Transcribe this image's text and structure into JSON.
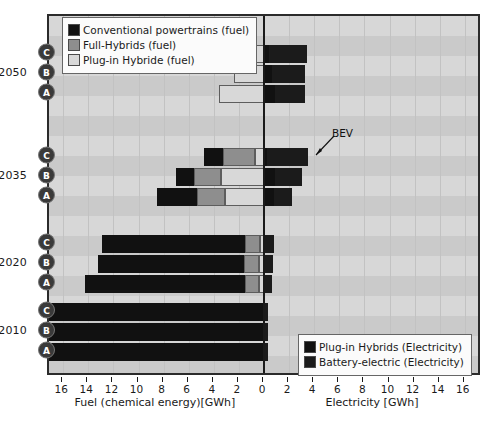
{
  "chart_data": {
    "type": "bar",
    "orientation": "horizontal-diverging",
    "title": "",
    "left_axis": {
      "label": "Fuel (chemical energy)[GWh]",
      "ticks": [
        16,
        14,
        12,
        10,
        8,
        6,
        4,
        2,
        0
      ],
      "direction": "reversed",
      "max": 17.2
    },
    "right_axis": {
      "label": "Electricity [GWh]",
      "ticks": [
        0,
        2,
        4,
        6,
        8,
        10,
        12,
        14,
        16
      ],
      "max": 17.2
    },
    "grid": true,
    "legend_position": [
      "top-left",
      "bottom-right"
    ],
    "year_groups": [
      "2050",
      "2035",
      "2020",
      "2010"
    ],
    "scenario_labels": [
      "C",
      "B",
      "A"
    ],
    "series": [
      {
        "name": "Conventional powertrains (fuel)",
        "color": "#111111",
        "side": "left"
      },
      {
        "name": "Full-Hybrids (fuel)",
        "color": "#8e8e8e",
        "side": "left"
      },
      {
        "name": "Plug-in Hybride (fuel)",
        "color": "#d8d8d8",
        "side": "left"
      },
      {
        "name": "Plug-in Hybrids (Electricity)",
        "color": "#111111",
        "side": "right"
      },
      {
        "name": "Battery-electric (Electricity)",
        "color": "#1b1b1b",
        "side": "right"
      }
    ],
    "annotations": [
      {
        "text": "BEV",
        "target_year": "2035",
        "target_scenario": "C"
      }
    ],
    "bars": [
      {
        "year": "2050",
        "scenario": "C",
        "fuel": {
          "conventional": 0.0,
          "full_hybrid": 0.0,
          "plug_in_hybrid": 1.5
        },
        "electricity": {
          "plug_in_hybrids": 0.4,
          "battery_electric": 3.0
        }
      },
      {
        "year": "2050",
        "scenario": "B",
        "fuel": {
          "conventional": 0.0,
          "full_hybrid": 0.0,
          "plug_in_hybrid": 2.4
        },
        "electricity": {
          "plug_in_hybrids": 0.6,
          "battery_electric": 2.7
        }
      },
      {
        "year": "2050",
        "scenario": "A",
        "fuel": {
          "conventional": 0.0,
          "full_hybrid": 0.0,
          "plug_in_hybrid": 3.6
        },
        "electricity": {
          "plug_in_hybrids": 0.9,
          "battery_electric": 2.4
        }
      },
      {
        "year": "2035",
        "scenario": "C",
        "fuel": {
          "conventional": 1.5,
          "full_hybrid": 2.6,
          "plug_in_hybrid": 0.7
        },
        "electricity": {
          "plug_in_hybrids": 0.2,
          "battery_electric": 3.3
        }
      },
      {
        "year": "2035",
        "scenario": "B",
        "fuel": {
          "conventional": 1.4,
          "full_hybrid": 2.2,
          "plug_in_hybrid": 3.4
        },
        "electricity": {
          "plug_in_hybrids": 0.9,
          "battery_electric": 2.1
        }
      },
      {
        "year": "2035",
        "scenario": "A",
        "fuel": {
          "conventional": 3.2,
          "full_hybrid": 2.2,
          "plug_in_hybrid": 3.1
        },
        "electricity": {
          "plug_in_hybrids": 0.8,
          "battery_electric": 1.4
        }
      },
      {
        "year": "2020",
        "scenario": "C",
        "fuel": {
          "conventional": 11.4,
          "full_hybrid": 1.2,
          "plug_in_hybrid": 0.3
        },
        "electricity": {
          "plug_in_hybrids": 0.1,
          "battery_electric": 0.7
        }
      },
      {
        "year": "2020",
        "scenario": "B",
        "fuel": {
          "conventional": 11.6,
          "full_hybrid": 1.2,
          "plug_in_hybrid": 0.4
        },
        "electricity": {
          "plug_in_hybrids": 0.1,
          "battery_electric": 0.6
        }
      },
      {
        "year": "2020",
        "scenario": "A",
        "fuel": {
          "conventional": 12.8,
          "full_hybrid": 1.1,
          "plug_in_hybrid": 0.4
        },
        "electricity": {
          "plug_in_hybrids": 0.1,
          "battery_electric": 0.5
        }
      },
      {
        "year": "2010",
        "scenario": "C",
        "fuel": {
          "conventional": 17.2,
          "full_hybrid": 0.0,
          "plug_in_hybrid": 0.0
        },
        "electricity": {
          "plug_in_hybrids": 0.0,
          "battery_electric": 0.3
        }
      },
      {
        "year": "2010",
        "scenario": "B",
        "fuel": {
          "conventional": 17.2,
          "full_hybrid": 0.0,
          "plug_in_hybrid": 0.0
        },
        "electricity": {
          "plug_in_hybrids": 0.0,
          "battery_electric": 0.3
        }
      },
      {
        "year": "2010",
        "scenario": "A",
        "fuel": {
          "conventional": 17.2,
          "full_hybrid": 0.0,
          "plug_in_hybrid": 0.0
        },
        "electricity": {
          "plug_in_hybrids": 0.0,
          "battery_electric": 0.3
        }
      }
    ]
  },
  "legend_fuel": {
    "items": [
      {
        "label": "Conventional powertrains (fuel)",
        "color": "#111111"
      },
      {
        "label": "Full-Hybrids (fuel)",
        "color": "#8e8e8e"
      },
      {
        "label": "Plug-in Hybride (fuel)",
        "color": "#d8d8d8"
      }
    ]
  },
  "legend_elec": {
    "items": [
      {
        "label": "Plug-in Hybrids (Electricity)",
        "color": "#111111"
      },
      {
        "label": "Battery-electric (Electricity)",
        "color": "#1b1b1b"
      }
    ]
  },
  "axis_titles": {
    "left": "Fuel (chemical energy)[GWh]",
    "right": "Electricity [GWh]"
  },
  "annotation_bev": "BEV"
}
